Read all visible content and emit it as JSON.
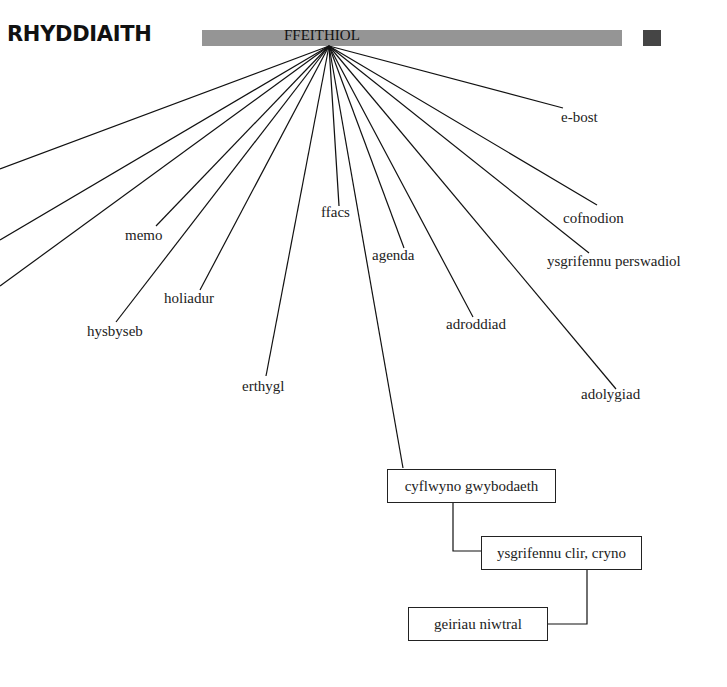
{
  "title": "RHYDDIAITH",
  "hub": {
    "label": "FFEITHIOL",
    "bar_color": "#959595",
    "square_color": "#454545"
  },
  "leaves": [
    {
      "label": "memo"
    },
    {
      "label": "hysbyseb"
    },
    {
      "label": "holiadur"
    },
    {
      "label": "erthygl"
    },
    {
      "label": "ffacs"
    },
    {
      "label": "agenda"
    },
    {
      "label": "adroddiad"
    },
    {
      "label": "adolygiad"
    },
    {
      "label": "ysgrifennu perswadiol"
    },
    {
      "label": "cofnodion"
    },
    {
      "label": "e-bost"
    }
  ],
  "chain": [
    {
      "label": "cyflwyno gwybodaeth"
    },
    {
      "label": "ysgrifennu clir, cryno"
    },
    {
      "label": "geiriau niwtral"
    }
  ]
}
